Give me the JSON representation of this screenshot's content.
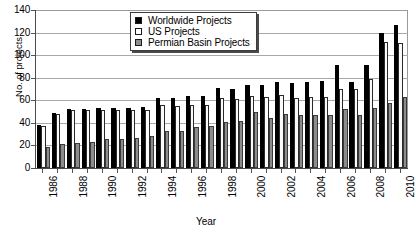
{
  "chart_data": {
    "type": "bar",
    "title": "",
    "xlabel": "Year",
    "ylabel": "No. of projects",
    "ylim": [
      0,
      140
    ],
    "ytick_step": 20,
    "yticks": [
      0,
      20,
      40,
      60,
      80,
      100,
      120,
      140
    ],
    "grid": true,
    "legend_position": "top-center",
    "categories": [
      "1986",
      "1987",
      "1988",
      "1989",
      "1990",
      "1991",
      "1992",
      "1993",
      "1994",
      "1995",
      "1996",
      "1997",
      "1998",
      "1999",
      "2000",
      "2001",
      "2002",
      "2003",
      "2004",
      "2005",
      "2006",
      "2007",
      "2008",
      "2009",
      "2010"
    ],
    "xtick_labels_shown": [
      "1986",
      "1988",
      "1990",
      "1992",
      "1994",
      "1996",
      "1998",
      "2000",
      "2002",
      "2004",
      "2006",
      "2008",
      "2010"
    ],
    "series": [
      {
        "name": "Worldwide Projects",
        "color": "#000000",
        "values": [
          38,
          49,
          52,
          52,
          53,
          53,
          53,
          54,
          62,
          62,
          64,
          64,
          71,
          70,
          74,
          74,
          76,
          75,
          76,
          77,
          91,
          76,
          91,
          120,
          127
        ]
      },
      {
        "name": "US Projects",
        "color": "#ffffff",
        "values": [
          37,
          48,
          51,
          51,
          51,
          51,
          51,
          51,
          56,
          55,
          56,
          56,
          62,
          61,
          64,
          63,
          65,
          62,
          63,
          63,
          70,
          70,
          79,
          112,
          111
        ]
      },
      {
        "name": "Permian Basin Projects",
        "color": "#8c8c8c",
        "values": [
          19,
          21,
          22,
          23,
          26,
          26,
          27,
          28,
          33,
          33,
          36,
          37,
          41,
          42,
          50,
          44,
          48,
          47,
          47,
          47,
          52,
          47,
          53,
          58,
          63
        ]
      }
    ]
  },
  "legend": {
    "items": [
      {
        "label": "Worldwide Projects"
      },
      {
        "label": "US Projects"
      },
      {
        "label": "Permian Basin Projects"
      }
    ]
  },
  "axes": {
    "y_title": "No. of projects",
    "x_title": "Year"
  }
}
